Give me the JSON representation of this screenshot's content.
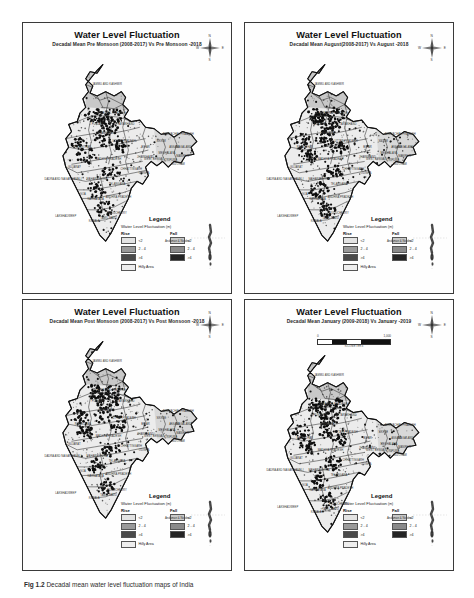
{
  "figure": {
    "caption_prefix": "Fig 1.2",
    "caption_text": "Decadal mean water level fluctuation maps of India"
  },
  "legend": {
    "title": "Legend",
    "subtitle": "Water Level Fluctuation",
    "unit": "(m)",
    "rise_header": "Rise",
    "fall_header": "Fall",
    "classes": [
      {
        "label": "<2",
        "rise_color": "#e3e3e3",
        "fall_color": "#c9c9c9"
      },
      {
        "label": "2 - 4",
        "rise_color": "#9a9a9a",
        "fall_color": "#8a8a8a"
      },
      {
        "label": ">4",
        "rise_color": "#4a4a4a",
        "fall_color": "#242424"
      }
    ],
    "hilly_label": "Hilly Area",
    "hilly_color": "#eeeeee"
  },
  "compass": {
    "n": "N",
    "s": "S",
    "e": "E",
    "w": "W"
  },
  "andaman": {
    "label": "Andaman & Nicobar"
  },
  "scalebar": {
    "min": "0",
    "max": "1,000",
    "units": "KILOMETERS"
  },
  "states": [
    {
      "name": "JAMMU AND KASHMIR",
      "x": 45,
      "y": 22
    },
    {
      "name": "HIMACHAL PRADESH",
      "x": 48,
      "y": 42
    },
    {
      "name": "PUNJAB",
      "x": 38,
      "y": 50
    },
    {
      "name": "UTTARAKHAND",
      "x": 57,
      "y": 50
    },
    {
      "name": "HARYANA",
      "x": 44,
      "y": 56
    },
    {
      "name": "RAJASTHAN",
      "x": 28,
      "y": 66
    },
    {
      "name": "UTTAR PRADESH",
      "x": 57,
      "y": 62
    },
    {
      "name": "BIHAR",
      "x": 72,
      "y": 66
    },
    {
      "name": "SIKKIM",
      "x": 83,
      "y": 62
    },
    {
      "name": "ARUNACHAL PRADESH",
      "x": 95,
      "y": 57
    },
    {
      "name": "ASSAM",
      "x": 92,
      "y": 66
    },
    {
      "name": "MEGHALAYA",
      "x": 87,
      "y": 70
    },
    {
      "name": "NAGALAND",
      "x": 99,
      "y": 66
    },
    {
      "name": "MANIPUR",
      "x": 98,
      "y": 72
    },
    {
      "name": "TRIPURA",
      "x": 90,
      "y": 75
    },
    {
      "name": "MIZORAM",
      "x": 95,
      "y": 78
    },
    {
      "name": "WEST BENGAL",
      "x": 78,
      "y": 74
    },
    {
      "name": "JHARKHAND",
      "x": 72,
      "y": 73
    },
    {
      "name": "GUJARAT",
      "x": 22,
      "y": 80
    },
    {
      "name": "MADHYA PRADESH",
      "x": 46,
      "y": 74
    },
    {
      "name": "CHHATTISGARH",
      "x": 62,
      "y": 81
    },
    {
      "name": "ODISHA",
      "x": 71,
      "y": 84
    },
    {
      "name": "DADRA AND NAGAR HAVELI",
      "x": 14,
      "y": 88
    },
    {
      "name": "MAHARASHTRA",
      "x": 38,
      "y": 88
    },
    {
      "name": "TELANGANA",
      "x": 52,
      "y": 92
    },
    {
      "name": "GOA",
      "x": 28,
      "y": 99
    },
    {
      "name": "ANDHRA PRADESH",
      "x": 53,
      "y": 101
    },
    {
      "name": "KARNATAKA",
      "x": 37,
      "y": 102
    },
    {
      "name": "PUDUCHERRY",
      "x": 52,
      "y": 112
    },
    {
      "name": "TAMIL NADU",
      "x": 46,
      "y": 116
    },
    {
      "name": "KERALA",
      "x": 36,
      "y": 118
    },
    {
      "name": "LAKSHADWEEP",
      "x": 16,
      "y": 114
    }
  ],
  "panels": [
    {
      "id": "pre-monsoon",
      "title": "Water Level Fluctuation",
      "subtitle": "Decadal Mean Pre Monsoon (2008-2017) Vs Pre Monsoon -2018",
      "has_scalebar": false,
      "density": 0.58,
      "seed": 11
    },
    {
      "id": "august",
      "title": "Water Level Fluctuation",
      "subtitle": "Decadal Mean August(2008-2017) Vs August -2018",
      "has_scalebar": false,
      "density": 0.7,
      "seed": 27
    },
    {
      "id": "post-monsoon",
      "title": "Water Level Fluctuation",
      "subtitle": "Decadal Mean Post Monsoon (2008-2017) Vs Post Monsoon -2018",
      "has_scalebar": false,
      "density": 0.62,
      "seed": 43
    },
    {
      "id": "january",
      "title": "Water Level Fluctuation",
      "subtitle": "Decadal Mean January (2009-2018) Vs January -2019",
      "has_scalebar": true,
      "density": 0.66,
      "seed": 59
    }
  ]
}
